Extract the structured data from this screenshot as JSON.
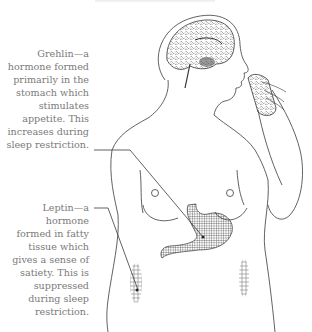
{
  "diagram": {
    "type": "annotated-illustration",
    "labels": [
      {
        "id": "grehlin",
        "lines": [
          "Grehlin—a",
          "hormone formed",
          "primarily in the",
          "stomach which",
          "stimulates",
          "appetite. This",
          "increases during",
          "sleep restriction."
        ],
        "points_to": "stomach"
      },
      {
        "id": "leptin",
        "lines": [
          "Leptin—a",
          "hormone",
          "formed in fatty",
          "tissue which",
          "gives a sense of",
          "satiety. This is",
          "suppressed",
          "during sleep",
          "restriction."
        ],
        "points_to": "fatty tissue"
      }
    ],
    "colors": {
      "text": "#7a7a7a",
      "line": "#3a3a3a",
      "background": "#ffffff"
    }
  }
}
